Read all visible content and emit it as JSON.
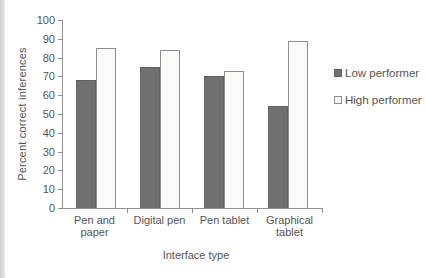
{
  "figure": {
    "background_color": "#ffffff",
    "scan_edge_color": "#cfcfcf",
    "axis_color": "#8f8f8f",
    "text_color": "#555555"
  },
  "chart_data": {
    "type": "bar",
    "xlabel": "Interface type",
    "ylabel": "Percent correct inferences",
    "categories": [
      "Pen and paper",
      "Digital pen",
      "Pen tablet",
      "Graphical tablet"
    ],
    "category_label_lines": [
      [
        "Pen and",
        "paper"
      ],
      [
        "Digital pen"
      ],
      [
        "Pen tablet"
      ],
      [
        "Graphical",
        "tablet"
      ]
    ],
    "series": [
      {
        "name": "Low performer",
        "values": [
          68,
          75,
          70,
          54
        ],
        "fill": "#707070",
        "border": "#616161"
      },
      {
        "name": "High performer",
        "values": [
          85,
          84,
          73,
          89
        ],
        "fill": "#fafaf8",
        "border": "#8e8e8e"
      }
    ],
    "ylim": [
      0,
      100
    ],
    "ytick_step": 10,
    "ytick_labels": [
      "0",
      "10",
      "20",
      "30",
      "40",
      "50",
      "60",
      "70",
      "80",
      "90",
      "100"
    ],
    "grid": false,
    "legend_position": "right-of-plot"
  }
}
